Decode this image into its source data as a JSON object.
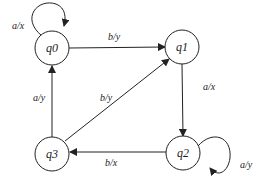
{
  "diagram": {
    "type": "finite-state-machine",
    "states": [
      {
        "id": "q0",
        "label": "q0"
      },
      {
        "id": "q1",
        "label": "q1"
      },
      {
        "id": "q2",
        "label": "q2"
      },
      {
        "id": "q3",
        "label": "q3"
      }
    ],
    "transitions": [
      {
        "from": "q0",
        "to": "q0",
        "label": "a/x"
      },
      {
        "from": "q0",
        "to": "q1",
        "label": "b/y"
      },
      {
        "from": "q1",
        "to": "q2",
        "label": "a/x"
      },
      {
        "from": "q2",
        "to": "q2",
        "label": "a/y"
      },
      {
        "from": "q2",
        "to": "q3",
        "label": "b/x"
      },
      {
        "from": "q3",
        "to": "q0",
        "label": "a/y"
      },
      {
        "from": "q3",
        "to": "q1",
        "label": "b/y"
      }
    ]
  }
}
